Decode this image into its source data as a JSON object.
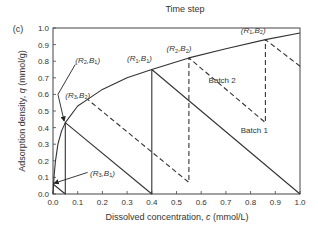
{
  "chart_data": {
    "type": "line",
    "panel_label": "(c)",
    "title": "Time step",
    "xlabel": "Dissolved concentration, c (mmol/L)",
    "ylabel": "Adsorption density, q (mmol/g)",
    "xlim": [
      0,
      1.0
    ],
    "ylim": [
      0,
      1.0
    ],
    "xticks": [
      "0.0",
      "0.1",
      "0.2",
      "0.3",
      "0.4",
      "0.5",
      "0.6",
      "0.7",
      "0.8",
      "0.9",
      "1.0"
    ],
    "yticks": [
      "0.0",
      "0.1",
      "0.2",
      "0.3",
      "0.4",
      "0.5",
      "0.6",
      "0.7",
      "0.8",
      "0.9",
      "1.0"
    ],
    "grid": false,
    "series": [
      {
        "name": "Isotherm",
        "style": "solid",
        "points": [
          [
            0,
            0
          ],
          [
            0.005,
            0.12
          ],
          [
            0.01,
            0.2
          ],
          [
            0.02,
            0.3
          ],
          [
            0.035,
            0.38
          ],
          [
            0.05,
            0.43
          ],
          [
            0.1,
            0.53
          ],
          [
            0.14,
            0.57
          ],
          [
            0.2,
            0.63
          ],
          [
            0.3,
            0.7
          ],
          [
            0.4,
            0.75
          ],
          [
            0.55,
            0.82
          ],
          [
            0.7,
            0.875
          ],
          [
            0.86,
            0.93
          ],
          [
            1.0,
            0.97
          ]
        ]
      },
      {
        "name": "Batch 1",
        "style": "solid",
        "points": [
          [
            1.0,
            0.0
          ],
          [
            0.4,
            0.75
          ],
          [
            0.4,
            0.0
          ],
          [
            0.05,
            0.43
          ],
          [
            0.05,
            0.0
          ],
          [
            0.0,
            0.06
          ]
        ]
      },
      {
        "name": "Batch 2",
        "style": "dashed",
        "points": [
          [
            1.0,
            0.77
          ],
          [
            0.86,
            0.93
          ],
          [
            0.86,
            0.43
          ],
          [
            0.55,
            0.82
          ],
          [
            0.55,
            0.07
          ],
          [
            0.14,
            0.57
          ]
        ]
      }
    ],
    "annotations": [
      {
        "text": "(R1,B1)",
        "sub": [
          "1",
          "1"
        ],
        "x": 0.4,
        "y": 0.75
      },
      {
        "text": "(R1,B2)",
        "sub": [
          "1",
          "2"
        ],
        "x": 0.86,
        "y": 0.93
      },
      {
        "text": "(R2,B1)",
        "sub": [
          "2",
          "1"
        ],
        "x": 0.05,
        "y": 0.43
      },
      {
        "text": "(R2,B2)",
        "sub": [
          "2",
          "2"
        ],
        "x": 0.55,
        "y": 0.82
      },
      {
        "text": "(R3,B2)",
        "sub": [
          "3",
          "2"
        ],
        "x": 0.14,
        "y": 0.57
      },
      {
        "text": "(R3,B1)",
        "sub": [
          "3",
          "1"
        ],
        "x": 0.0,
        "y": 0.06
      },
      {
        "text": "Batch 1",
        "x": 0.8,
        "y": 0.38
      },
      {
        "text": "Batch 2",
        "x": 0.63,
        "y": 0.68
      }
    ]
  },
  "labels": {
    "title": "Time step",
    "panel": "(c)",
    "xlabel_pre": "Dissolved concentration, ",
    "xlabel_var": "c",
    "xlabel_post": " (mmol/L)",
    "ylabel_pre": "Adsorption density, ",
    "ylabel_var": "q",
    "ylabel_post": " (mmol/g)",
    "batch1": "Batch 1",
    "batch2": "Batch 2"
  }
}
